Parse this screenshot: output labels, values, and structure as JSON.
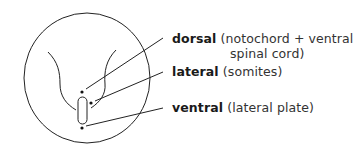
{
  "diagram": {
    "type": "embryo-cross-section",
    "labels": [
      {
        "term": "dorsal",
        "description_line1": "(notochord + ventral",
        "description_line2": "spinal cord)"
      },
      {
        "term": "lateral",
        "description_line1": "(somites)"
      },
      {
        "term": "ventral",
        "description_line1": "(lateral plate)"
      }
    ],
    "colors": {
      "stroke": "#222222",
      "background": "#ffffff"
    }
  }
}
